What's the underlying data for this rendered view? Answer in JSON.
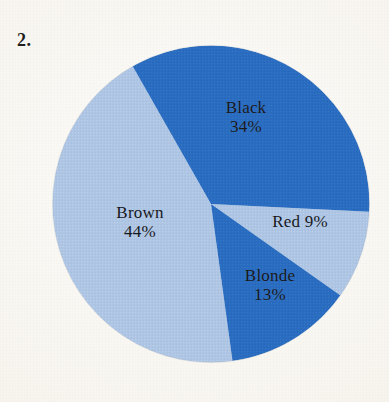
{
  "item_number": "2.",
  "chart_data": {
    "type": "pie",
    "title": "",
    "subtitle": "",
    "xlabel": "",
    "ylabel": "",
    "legend_position": "none",
    "grid": false,
    "units": "percent",
    "total": 100,
    "center": {
      "x": 211,
      "y": 204
    },
    "radius": 158,
    "start_angle_deg": -29.6,
    "direction": "clockwise",
    "categories": [
      "Black",
      "Brown",
      "Red",
      "Blonde"
    ],
    "values": [
      34,
      44,
      9,
      13
    ],
    "slices": [
      {
        "name": "Black",
        "label": "Black",
        "value": 34,
        "value_label": "34%",
        "color": "#2a6dc0",
        "text_color": "#17181c",
        "start_angle_deg": -29.6,
        "end_angle_deg": 92.8,
        "sweep_deg": 122.4,
        "label_layout": "stacked"
      },
      {
        "name": "Brown",
        "label": "Brown",
        "value": 44,
        "value_label": "44%",
        "color": "#aec5e4",
        "text_color": "#17181c",
        "start_angle_deg": 172.2,
        "end_angle_deg": 330.4,
        "sweep_deg": 158.4,
        "label_layout": "stacked"
      },
      {
        "name": "Red",
        "label": "Red",
        "value": 9,
        "value_label": "9%",
        "color": "#aec5e4",
        "text_color": "#17181c",
        "start_angle_deg": 92.8,
        "end_angle_deg": 125.2,
        "sweep_deg": 32.4,
        "label_layout": "inline"
      },
      {
        "name": "Blonde",
        "label": "Blonde",
        "value": 13,
        "value_label": "13%",
        "color": "#2a6dc0",
        "text_color": "#17181c",
        "start_angle_deg": 125.2,
        "end_angle_deg": 172.2,
        "sweep_deg": 47,
        "label_layout": "stacked"
      }
    ],
    "colors": {
      "dark_blue": "#2a6dc0",
      "light_blue": "#aec5e4",
      "background": "#fbf9f5",
      "text": "#17181c"
    }
  }
}
